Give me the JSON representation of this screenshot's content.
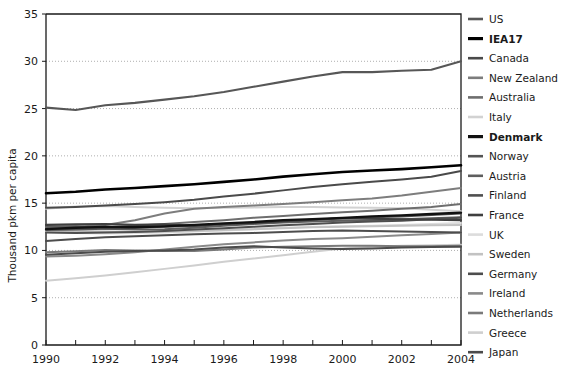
{
  "chart_data": {
    "type": "line",
    "title": "",
    "xlabel": "",
    "ylabel": "Thousand pkm per capita",
    "x": [
      1990,
      1991,
      1992,
      1993,
      1994,
      1995,
      1996,
      1997,
      1998,
      1999,
      2000,
      2001,
      2002,
      2003,
      2004
    ],
    "xlim": [
      1990,
      2004
    ],
    "ylim": [
      0,
      35
    ],
    "yticks": [
      0,
      5,
      10,
      15,
      20,
      25,
      30,
      35
    ],
    "xticks": [
      1990,
      1991,
      1992,
      1993,
      1994,
      1995,
      1996,
      1997,
      1998,
      1999,
      2000,
      2001,
      2002,
      2003,
      2004
    ],
    "xtick_labels": [
      "1990",
      "",
      "1992",
      "",
      "1994",
      "",
      "1996",
      "",
      "1998",
      "",
      "2000",
      "",
      "2002",
      "",
      "2004"
    ],
    "grid": "horizontal-dotted",
    "legend_position": "right",
    "series": [
      {
        "name": "US",
        "color": "#575757",
        "width": 2.1,
        "bold": false,
        "values": [
          25.1,
          24.85,
          25.35,
          25.6,
          25.95,
          26.3,
          26.75,
          27.3,
          27.85,
          28.4,
          28.85,
          28.85,
          29.0,
          29.1,
          30.0
        ]
      },
      {
        "name": "IEA17",
        "color": "#000000",
        "width": 2.6,
        "bold": true,
        "values": [
          16.05,
          16.2,
          16.45,
          16.6,
          16.8,
          17.0,
          17.25,
          17.5,
          17.8,
          18.05,
          18.3,
          18.45,
          18.6,
          18.8,
          19.0
        ]
      },
      {
        "name": "Canada",
        "color": "#4a4a4a",
        "width": 2.0,
        "bold": false,
        "values": [
          14.5,
          14.6,
          14.75,
          14.9,
          15.1,
          15.35,
          15.7,
          16.0,
          16.35,
          16.7,
          17.0,
          17.25,
          17.5,
          17.8,
          18.4
        ]
      },
      {
        "name": "New Zealand",
        "color": "#7d7d7d",
        "width": 2.0,
        "bold": false,
        "values": [
          12.4,
          12.5,
          12.7,
          13.2,
          13.9,
          14.4,
          14.6,
          14.75,
          14.9,
          15.1,
          15.3,
          15.5,
          15.8,
          16.2,
          16.6
        ]
      },
      {
        "name": "Australia",
        "color": "#6e6e6e",
        "width": 2.0,
        "bold": false,
        "values": [
          12.3,
          12.35,
          12.45,
          12.6,
          12.8,
          13.0,
          13.2,
          13.45,
          13.65,
          13.85,
          14.05,
          14.2,
          14.4,
          14.6,
          14.9
        ]
      },
      {
        "name": "Italy",
        "color": "#d2d2d2",
        "width": 2.0,
        "bold": false,
        "values": [
          14.4,
          14.65,
          14.7,
          14.6,
          14.5,
          14.45,
          14.5,
          14.55,
          14.6,
          14.6,
          14.55,
          14.5,
          14.45,
          14.3,
          14.15
        ]
      },
      {
        "name": "Denmark",
        "color": "#111111",
        "width": 2.3,
        "bold": true,
        "values": [
          12.25,
          12.4,
          12.5,
          12.45,
          12.55,
          12.7,
          12.85,
          13.0,
          13.2,
          13.3,
          13.45,
          13.6,
          13.7,
          13.85,
          14.0
        ]
      },
      {
        "name": "Norway",
        "color": "#545454",
        "width": 2.0,
        "bold": false,
        "values": [
          12.15,
          12.2,
          12.3,
          12.4,
          12.5,
          12.6,
          12.8,
          12.95,
          13.1,
          13.25,
          13.4,
          13.5,
          13.6,
          13.75,
          13.9
        ]
      },
      {
        "name": "Austria",
        "color": "#5e5e5e",
        "width": 2.0,
        "bold": false,
        "values": [
          12.5,
          12.55,
          12.3,
          12.2,
          12.25,
          12.4,
          12.6,
          12.8,
          12.95,
          13.05,
          13.15,
          13.2,
          13.3,
          13.4,
          13.5
        ]
      },
      {
        "name": "Finland",
        "color": "#4f4f4f",
        "width": 2.0,
        "bold": false,
        "values": [
          11.9,
          11.85,
          11.9,
          11.95,
          12.05,
          12.2,
          12.35,
          12.5,
          12.65,
          12.8,
          12.95,
          13.05,
          13.15,
          13.3,
          13.45
        ]
      },
      {
        "name": "France",
        "color": "#3f3f3f",
        "width": 2.1,
        "bold": false,
        "values": [
          12.7,
          12.75,
          12.8,
          12.7,
          12.75,
          12.6,
          12.8,
          12.9,
          13.1,
          13.25,
          13.4,
          13.35,
          13.3,
          13.25,
          13.2
        ]
      },
      {
        "name": "UK",
        "color": "#dcdcdc",
        "width": 2.0,
        "bold": false,
        "values": [
          11.95,
          11.85,
          11.8,
          11.85,
          11.9,
          12.0,
          12.1,
          12.25,
          12.4,
          12.5,
          12.55,
          12.6,
          12.7,
          12.8,
          12.9
        ]
      },
      {
        "name": "Sweden",
        "color": "#c2c2c2",
        "width": 2.0,
        "bold": false,
        "values": [
          12.1,
          12.05,
          12.0,
          11.95,
          12.0,
          12.05,
          12.15,
          12.25,
          12.35,
          12.45,
          12.5,
          12.55,
          12.6,
          12.65,
          12.7
        ]
      },
      {
        "name": "Germany",
        "color": "#4d4d4d",
        "width": 2.0,
        "bold": false,
        "values": [
          11.0,
          11.2,
          11.4,
          11.5,
          11.6,
          11.7,
          11.8,
          11.85,
          11.95,
          12.05,
          12.1,
          12.05,
          12.0,
          11.95,
          11.9
        ]
      },
      {
        "name": "Ireland",
        "color": "#8a8a8a",
        "width": 2.0,
        "bold": false,
        "values": [
          9.35,
          9.45,
          9.6,
          9.8,
          10.1,
          10.4,
          10.65,
          10.85,
          11.05,
          11.2,
          11.3,
          11.45,
          11.6,
          11.75,
          11.9
        ]
      },
      {
        "name": "Netherlands",
        "color": "#7a7a7a",
        "width": 2.0,
        "bold": false,
        "values": [
          9.8,
          9.9,
          10.05,
          10.0,
          9.95,
          9.95,
          10.1,
          10.3,
          10.4,
          10.45,
          10.5,
          10.5,
          10.45,
          10.45,
          10.5
        ]
      },
      {
        "name": "Greece",
        "color": "#cfcfcf",
        "width": 2.0,
        "bold": false,
        "values": [
          6.8,
          7.05,
          7.35,
          7.7,
          8.05,
          8.4,
          8.8,
          9.15,
          9.5,
          9.85,
          10.2,
          10.4,
          10.5,
          10.55,
          10.6
        ]
      },
      {
        "name": "Japan",
        "color": "#4b4b4b",
        "width": 2.0,
        "bold": false,
        "values": [
          9.55,
          9.7,
          9.85,
          9.95,
          10.0,
          10.1,
          10.3,
          10.45,
          10.3,
          10.2,
          10.15,
          10.2,
          10.3,
          10.35,
          10.4
        ]
      }
    ]
  }
}
